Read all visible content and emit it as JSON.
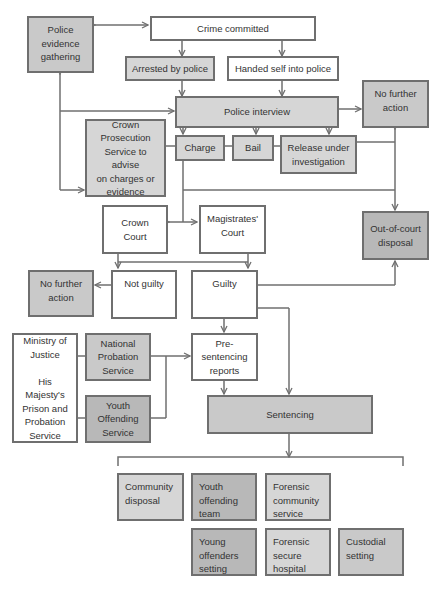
{
  "diagram": {
    "type": "flowchart",
    "nodes": {
      "police_evidence": "Police\nevidence\ngathering",
      "crime_committed": "Crime committed",
      "arrested": "Arrested by police",
      "handed_self": "Handed self into police",
      "police_interview": "Police interview",
      "nfa_top": "No further\naction",
      "cps": "Crown\nProsecution\nService to advise\non charges or\nevidence",
      "charge": "Charge",
      "bail": "Bail",
      "release": "Release under\ninvestigation",
      "crown_court": "Crown\nCourt",
      "magistrates_court": "Magistrates'\nCourt",
      "out_of_court": "Out-of-court\ndisposal",
      "nfa_mid": "No further\naction",
      "not_guilty": "Not guilty",
      "guilty": "Guilty",
      "moj": "Ministry of\nJustice\n\nHis\nMajesty's\nPrison and\nProbation\nService",
      "nps": "National\nProbation\nService",
      "yos": "Youth\nOffending\nService",
      "pre_sentencing": "Pre-\nsentencing\nreports",
      "sentencing": "Sentencing",
      "community_disposal": "Community\ndisposal",
      "youth_offending_team": "Youth\noffending\nteam",
      "forensic_community": "Forensic\ncommunity\nservice",
      "young_offenders": "Young\noffenders\nsetting",
      "forensic_hospital": "Forensic\nsecure\nhospital",
      "custodial": "Custodial\nsetting"
    },
    "edges": [
      {
        "from": "police_evidence",
        "to": "crime_committed",
        "bidirectional": true
      },
      {
        "from": "crime_committed",
        "to": "arrested"
      },
      {
        "from": "crime_committed",
        "to": "handed_self"
      },
      {
        "from": "arrested",
        "to": "police_interview"
      },
      {
        "from": "handed_self",
        "to": "police_interview"
      },
      {
        "from": "police_interview",
        "to": "nfa_top"
      },
      {
        "from": "police_interview",
        "to": "charge"
      },
      {
        "from": "police_interview",
        "to": "release"
      },
      {
        "from": "police_evidence",
        "to": "police_interview"
      },
      {
        "from": "police_evidence",
        "to": "cps"
      },
      {
        "from": "release",
        "to": "nfa_top"
      },
      {
        "from": "release",
        "to": "out_of_court"
      },
      {
        "from": "charge",
        "to": "crown_court"
      },
      {
        "from": "charge",
        "to": "magistrates_court"
      },
      {
        "from": "crown_court",
        "to": "not_guilty"
      },
      {
        "from": "magistrates_court",
        "to": "guilty"
      },
      {
        "from": "not_guilty",
        "to": "nfa_mid"
      },
      {
        "from": "guilty",
        "to": "out_of_court"
      },
      {
        "from": "guilty",
        "to": "pre_sentencing"
      },
      {
        "from": "guilty",
        "to": "sentencing"
      },
      {
        "from": "nps",
        "to": "pre_sentencing"
      },
      {
        "from": "yos",
        "to": "pre_sentencing"
      },
      {
        "from": "pre_sentencing",
        "to": "sentencing"
      },
      {
        "from": "sentencing",
        "to": "outcomes"
      }
    ],
    "colors": {
      "white": "#ffffff",
      "light_grey": "#d6d6d6",
      "mid_grey": "#c9c9c9",
      "dark_grey": "#b8b8b8",
      "border": "#6f6f6f"
    }
  }
}
